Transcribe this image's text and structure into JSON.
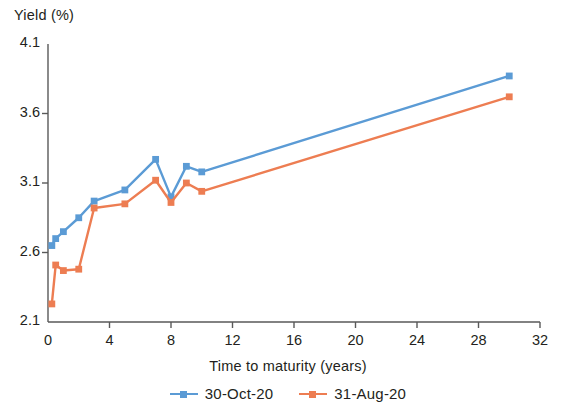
{
  "chart_data": {
    "type": "line",
    "title": "",
    "subtitle": "",
    "xlabel": "Time to maturity (years)",
    "ylabel": "Yield (%)",
    "xlim": [
      0,
      32
    ],
    "ylim": [
      2.1,
      4.1
    ],
    "xticks": [
      "0",
      "4",
      "8",
      "12",
      "16",
      "20",
      "24",
      "28",
      "32"
    ],
    "yticks": [
      "2.1",
      "2.6",
      "3.1",
      "3.6",
      "4.1"
    ],
    "grid": false,
    "legend_position": "bottom",
    "markers": "square",
    "series": [
      {
        "name": "30-Oct-20",
        "color": "#5B9BD5",
        "x": [
          0.25,
          0.5,
          1,
          2,
          3,
          5,
          7,
          8,
          9,
          10,
          30
        ],
        "values": [
          2.65,
          2.7,
          2.75,
          2.85,
          2.97,
          3.05,
          3.27,
          3.0,
          3.22,
          3.18,
          3.87
        ]
      },
      {
        "name": "31-Aug-20",
        "color": "#ED7D52",
        "x": [
          0.25,
          0.5,
          1,
          2,
          3,
          5,
          7,
          8,
          9,
          10,
          30
        ],
        "values": [
          2.23,
          2.51,
          2.47,
          2.48,
          2.92,
          2.95,
          3.12,
          2.96,
          3.1,
          3.04,
          3.72
        ]
      }
    ]
  },
  "axis": {
    "y_title": "Yield (%)",
    "x_title": "Time to maturity (years)"
  },
  "legend": {
    "items": [
      {
        "label": "30-Oct-20",
        "color": "#5B9BD5"
      },
      {
        "label": "31-Aug-20",
        "color": "#ED7D52"
      }
    ]
  },
  "colors": {
    "series_blue": "#5B9BD5",
    "series_orange": "#ED7D52",
    "axis": "#595959",
    "text": "#231f20"
  }
}
